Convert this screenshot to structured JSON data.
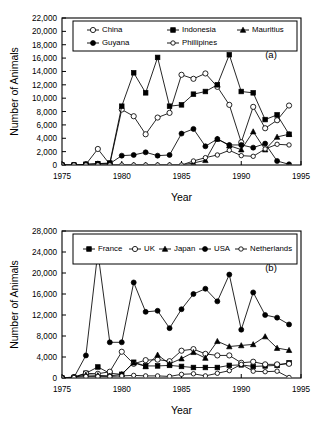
{
  "figure": {
    "panels": [
      "a",
      "b"
    ],
    "axis_color": "#000000",
    "background": "#ffffff"
  },
  "chart_data": [
    {
      "type": "line",
      "panel_label": "(a)",
      "title": "",
      "xlabel": "Year",
      "ylabel": "Number of Animals",
      "xlim": [
        1975,
        1995
      ],
      "ylim": [
        0,
        22000
      ],
      "xticks": [
        1975,
        1980,
        1985,
        1990,
        1995
      ],
      "xtick_labels": [
        "1975",
        "1980",
        "1985",
        "1990",
        "1995"
      ],
      "yticks": [
        0,
        2000,
        4000,
        6000,
        8000,
        10000,
        12000,
        14000,
        16000,
        18000,
        20000,
        22000
      ],
      "ytick_labels": [
        "0",
        "2,000",
        "4,000",
        "6,000",
        "8,000",
        "10,000",
        "12,000",
        "14,000",
        "16,000",
        "18,000",
        "20,000",
        "22,000"
      ],
      "grid": false,
      "legend_position": "top-inside",
      "x": [
        1975,
        1976,
        1977,
        1978,
        1979,
        1980,
        1981,
        1982,
        1983,
        1984,
        1985,
        1986,
        1987,
        1988,
        1989,
        1990,
        1991,
        1992,
        1993,
        1994
      ],
      "series": [
        {
          "name": "China",
          "marker": "open-circle",
          "values": [
            0,
            0,
            100,
            2400,
            100,
            8300,
            7300,
            4600,
            7100,
            7800,
            13500,
            12900,
            13700,
            11700,
            9000,
            3400,
            8700,
            5500,
            6700,
            8900
          ]
        },
        {
          "name": "Indonesia",
          "marker": "filled-square",
          "values": [
            0,
            0,
            100,
            200,
            300,
            8800,
            13800,
            10800,
            16100,
            8800,
            9000,
            10600,
            11000,
            12000,
            16500,
            11000,
            10800,
            6800,
            7500,
            4600
          ]
        },
        {
          "name": "Mauritius",
          "marker": "filled-triangle",
          "values": [
            0,
            0,
            0,
            0,
            0,
            0,
            0,
            0,
            0,
            0,
            0,
            300,
            700,
            3900,
            2900,
            2300,
            5000,
            2300,
            4200,
            4600
          ]
        },
        {
          "name": "Guyana",
          "marker": "filled-circle",
          "values": [
            0,
            0,
            100,
            200,
            200,
            1400,
            1500,
            1900,
            1400,
            1500,
            4700,
            5400,
            2800,
            3900,
            3000,
            3000,
            2600,
            3200,
            600,
            100
          ]
        },
        {
          "name": "Phillipines",
          "marker": "open-circle-small",
          "values": [
            0,
            0,
            0,
            0,
            0,
            0,
            0,
            0,
            0,
            0,
            0,
            600,
            1100,
            1500,
            2200,
            1400,
            1300,
            2400,
            3100,
            3000
          ]
        }
      ]
    },
    {
      "type": "line",
      "panel_label": "(b)",
      "title": "",
      "xlabel": "Year",
      "ylabel": "Number of Animals",
      "xlim": [
        1975,
        1995
      ],
      "ylim": [
        0,
        28000
      ],
      "xticks": [
        1975,
        1980,
        1985,
        1990,
        1995
      ],
      "xtick_labels": [
        "1975",
        "1980",
        "1985",
        "1990",
        "1995"
      ],
      "yticks": [
        0,
        4000,
        8000,
        12000,
        16000,
        20000,
        24000,
        28000
      ],
      "ytick_labels": [
        "0",
        "4,000",
        "8,000",
        "12,000",
        "16,000",
        "20,000",
        "24,000",
        "28,000"
      ],
      "grid": false,
      "legend_position": "top-inside",
      "x": [
        1975,
        1976,
        1977,
        1978,
        1979,
        1980,
        1981,
        1982,
        1983,
        1984,
        1985,
        1986,
        1987,
        1988,
        1989,
        1990,
        1991,
        1992,
        1993,
        1994
      ],
      "series": [
        {
          "name": "France",
          "marker": "filled-square",
          "values": [
            0,
            100,
            900,
            2100,
            900,
            700,
            3000,
            2300,
            2300,
            2400,
            2200,
            2000,
            2000,
            2000,
            2400,
            2500,
            2200,
            2300,
            2400,
            2900
          ]
        },
        {
          "name": "UK",
          "marker": "open-circle",
          "values": [
            0,
            200,
            900,
            800,
            1200,
            5000,
            2700,
            3400,
            3500,
            3200,
            5200,
            5500,
            4600,
            4300,
            4300,
            2900,
            3100,
            2600,
            2600,
            2700
          ]
        },
        {
          "name": "Japan",
          "marker": "filled-triangle",
          "values": [
            0,
            100,
            600,
            500,
            400,
            700,
            2900,
            2200,
            4400,
            2700,
            3700,
            4900,
            3800,
            7000,
            6000,
            6200,
            6400,
            7900,
            5700,
            5300
          ]
        },
        {
          "name": "USA",
          "marker": "filled-circle",
          "values": [
            0,
            100,
            4300,
            24000,
            6800,
            6800,
            18200,
            12600,
            12800,
            9500,
            13100,
            16000,
            17000,
            14600,
            19700,
            9200,
            16300,
            12000,
            11500,
            10200
          ]
        },
        {
          "name": "Netherlands",
          "marker": "open-circle-small",
          "values": [
            0,
            100,
            300,
            300,
            300,
            400,
            500,
            400,
            400,
            300,
            700,
            800,
            400,
            900,
            1400,
            2600,
            1300,
            1200,
            1300,
            100
          ]
        }
      ]
    }
  ]
}
